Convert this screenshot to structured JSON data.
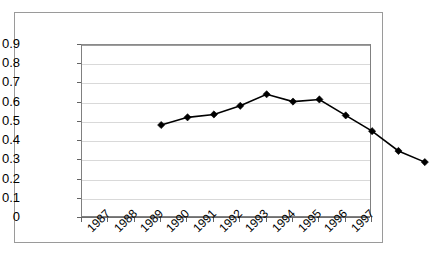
{
  "chart_data": {
    "type": "line",
    "title": "",
    "subtitle": "",
    "xlabel": "",
    "ylabel": "",
    "categories": [
      "1987",
      "1988",
      "1989",
      "1990",
      "1991",
      "1992",
      "1993",
      "1994",
      "1995",
      "1996",
      "1997"
    ],
    "values": [
      0.645,
      0.685,
      0.7,
      0.745,
      0.805,
      0.767,
      0.778,
      0.695,
      0.613,
      0.51,
      0.452
    ],
    "series": [
      {
        "name": "",
        "values": [
          0.645,
          0.685,
          0.7,
          0.745,
          0.805,
          0.767,
          0.778,
          0.695,
          0.613,
          0.51,
          0.452
        ]
      }
    ],
    "ylim": [
      0,
      0.9
    ],
    "ytick_labels": [
      "0.9",
      "0.8",
      "0.7",
      "0.6",
      "0.5",
      "0.4",
      "0.3",
      "0.2",
      "0.1",
      "0"
    ],
    "ytick_values": [
      0.9,
      0.8,
      0.7,
      0.6,
      0.5,
      0.4,
      0.3,
      0.2,
      0.1,
      0
    ],
    "ytick_step": 0.1,
    "grid": "horizontal",
    "legend": "none",
    "marker": "diamond",
    "xlabel_rotation": -45,
    "annotations": [],
    "colors": {
      "line": "#000000",
      "marker": "#000000",
      "gridline": "#d9d9d9",
      "axis": "#6e6e6e",
      "plot_border": "#808080",
      "outer_border": "#9a9a9a",
      "background": "#ffffff",
      "text": "#000000"
    }
  }
}
